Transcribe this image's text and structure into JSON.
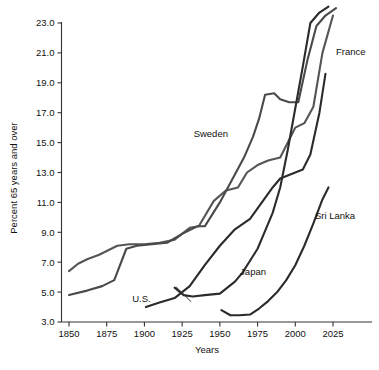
{
  "chart_data": {
    "type": "line",
    "title": "",
    "xlabel": "Years",
    "ylabel": "Percent 65 years and over",
    "xlim": [
      1845,
      2040
    ],
    "ylim": [
      3.0,
      24.0
    ],
    "grid": false,
    "legend_position": "inline-annotations",
    "xticks": [
      1850,
      1875,
      1900,
      1925,
      1950,
      1975,
      2000,
      2025
    ],
    "xtick_labels": [
      "1850",
      "1875",
      "1900",
      "1925",
      "1950",
      "1975",
      "2000",
      "2025"
    ],
    "yticks": [
      3.0,
      5.0,
      7.0,
      9.0,
      11.0,
      13.0,
      15.0,
      17.0,
      19.0,
      21.0,
      23.0
    ],
    "ytick_labels": [
      "3.0",
      "5.0",
      "7.0",
      "9.0",
      "11.0",
      "13.0",
      "15.0",
      "17.0",
      "19.0",
      "21.0",
      "23.0"
    ],
    "series": [
      {
        "name": "France",
        "color": "#555555",
        "label_x": 2027,
        "label_y": 21.1,
        "points": [
          [
            1850,
            6.4
          ],
          [
            1856,
            6.9
          ],
          [
            1862,
            7.2
          ],
          [
            1870,
            7.5
          ],
          [
            1876,
            7.8
          ],
          [
            1882,
            8.1
          ],
          [
            1890,
            8.2
          ],
          [
            1900,
            8.2
          ],
          [
            1910,
            8.3
          ],
          [
            1920,
            8.5
          ],
          [
            1930,
            9.3
          ],
          [
            1936,
            9.4
          ],
          [
            1946,
            11.1
          ],
          [
            1954,
            11.8
          ],
          [
            1962,
            12.0
          ],
          [
            1968,
            13.0
          ],
          [
            1975,
            13.5
          ],
          [
            1982,
            13.8
          ],
          [
            1990,
            14.0
          ],
          [
            2000,
            16.0
          ],
          [
            2006,
            16.3
          ],
          [
            2012,
            17.4
          ],
          [
            2018,
            21.0
          ],
          [
            2025,
            23.5
          ]
        ]
      },
      {
        "name": "Sweden",
        "color": "#4a4a4a",
        "label_x": 1944,
        "label_y": 15.6,
        "points": [
          [
            1850,
            4.8
          ],
          [
            1862,
            5.1
          ],
          [
            1872,
            5.4
          ],
          [
            1880,
            5.8
          ],
          [
            1888,
            7.9
          ],
          [
            1895,
            8.1
          ],
          [
            1905,
            8.2
          ],
          [
            1915,
            8.3
          ],
          [
            1925,
            8.9
          ],
          [
            1935,
            9.4
          ],
          [
            1940,
            9.4
          ],
          [
            1950,
            11.0
          ],
          [
            1958,
            12.5
          ],
          [
            1966,
            14.0
          ],
          [
            1972,
            15.4
          ],
          [
            1976,
            16.6
          ],
          [
            1980,
            18.2
          ],
          [
            1986,
            18.3
          ],
          [
            1990,
            17.9
          ],
          [
            1996,
            17.7
          ],
          [
            2002,
            17.7
          ],
          [
            2008,
            20.5
          ],
          [
            2014,
            22.8
          ],
          [
            2020,
            23.5
          ],
          [
            2027,
            24.0
          ]
        ]
      },
      {
        "name": "U.S.",
        "color": "#2b2b2b",
        "label_x": 1898,
        "label_y": 4.55,
        "points": [
          [
            1901,
            4.0
          ],
          [
            1910,
            4.3
          ],
          [
            1920,
            4.6
          ],
          [
            1930,
            5.4
          ],
          [
            1940,
            6.8
          ],
          [
            1950,
            8.1
          ],
          [
            1960,
            9.2
          ],
          [
            1970,
            9.9
          ],
          [
            1975,
            10.6
          ],
          [
            1980,
            11.3
          ],
          [
            1985,
            12.0
          ],
          [
            1990,
            12.6
          ],
          [
            2000,
            13.0
          ],
          [
            2005,
            13.2
          ],
          [
            2010,
            14.2
          ],
          [
            2016,
            17.0
          ],
          [
            2020,
            19.6
          ]
        ]
      },
      {
        "name": "Japan",
        "color": "#2b2b2b",
        "label_x": 1972,
        "label_y": 6.4,
        "points": [
          [
            1920,
            5.3
          ],
          [
            1926,
            4.8
          ],
          [
            1932,
            4.7
          ],
          [
            1940,
            4.8
          ],
          [
            1950,
            4.9
          ],
          [
            1955,
            5.3
          ],
          [
            1960,
            5.7
          ],
          [
            1965,
            6.3
          ],
          [
            1970,
            7.1
          ],
          [
            1975,
            7.9
          ],
          [
            1980,
            9.1
          ],
          [
            1985,
            10.3
          ],
          [
            1990,
            12.0
          ],
          [
            1995,
            14.5
          ],
          [
            2000,
            17.3
          ],
          [
            2005,
            20.1
          ],
          [
            2010,
            23.0
          ],
          [
            2016,
            23.7
          ],
          [
            2022,
            24.1
          ]
        ]
      },
      {
        "name": "Sri Lanka",
        "color": "#2b2b2b",
        "label_x": 2013,
        "label_y": 10.1,
        "points": [
          [
            1951,
            3.8
          ],
          [
            1957,
            3.45
          ],
          [
            1963,
            3.45
          ],
          [
            1970,
            3.5
          ],
          [
            1976,
            3.9
          ],
          [
            1982,
            4.4
          ],
          [
            1988,
            5.0
          ],
          [
            1994,
            5.8
          ],
          [
            2000,
            6.8
          ],
          [
            2006,
            8.1
          ],
          [
            2012,
            9.6
          ],
          [
            2018,
            11.2
          ],
          [
            2022,
            12.0
          ]
        ]
      }
    ]
  },
  "axes": {
    "x_title": "Years",
    "y_title": "Percent 65 years and over"
  }
}
